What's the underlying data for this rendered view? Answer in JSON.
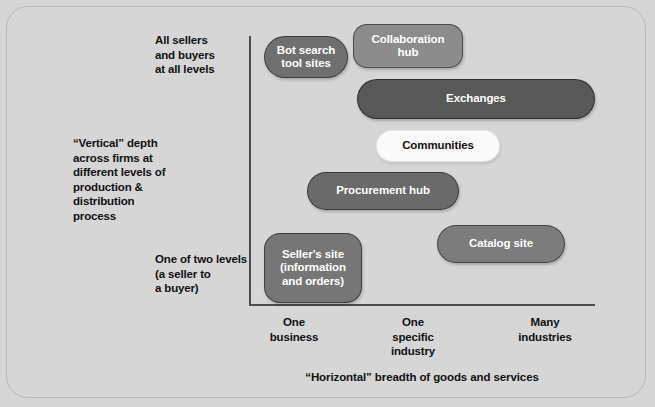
{
  "diagram": {
    "title_caption": "“Horizontal” breadth of goods and services",
    "axes": {
      "y_labels": {
        "top": "All sellers\nand buyers\nat all levels",
        "middle": "“Vertical” depth\nacross firms at\ndifferent levels of\nproduction &\ndistribution\nprocess",
        "bottom": "One of two levels\n(a seller to\na buyer)"
      },
      "x_ticks": [
        "One\nbusiness",
        "One\nspecific\nindustry",
        "Many\nindustries"
      ]
    },
    "nodes": [
      {
        "id": "bot-search-tool-sites",
        "label": "Bot search\ntool sites",
        "color": "#6f6f6f",
        "text_color": "#ffffff"
      },
      {
        "id": "collaboration-hub",
        "label": "Collaboration\nhub",
        "color": "#8c8c8c",
        "text_color": "#ffffff"
      },
      {
        "id": "exchanges",
        "label": "Exchanges",
        "color": "#585858",
        "text_color": "#ffffff"
      },
      {
        "id": "communities",
        "label": "Communities",
        "color": "#fafafa",
        "text_color": "#111111"
      },
      {
        "id": "procurement-hub",
        "label": "Procurement hub",
        "color": "#6a6a6a",
        "text_color": "#ffffff"
      },
      {
        "id": "catalog-site",
        "label": "Catalog site",
        "color": "#7c7c7c",
        "text_color": "#ffffff"
      },
      {
        "id": "sellers-site",
        "label": "Seller's site\n(information\nand orders)",
        "color": "#767676",
        "text_color": "#ffffff"
      }
    ],
    "colors": {
      "background": "#d6d6d6",
      "frame_border": "#b9b9b9",
      "axis": "#4c4c4c",
      "text": "#111111"
    }
  }
}
